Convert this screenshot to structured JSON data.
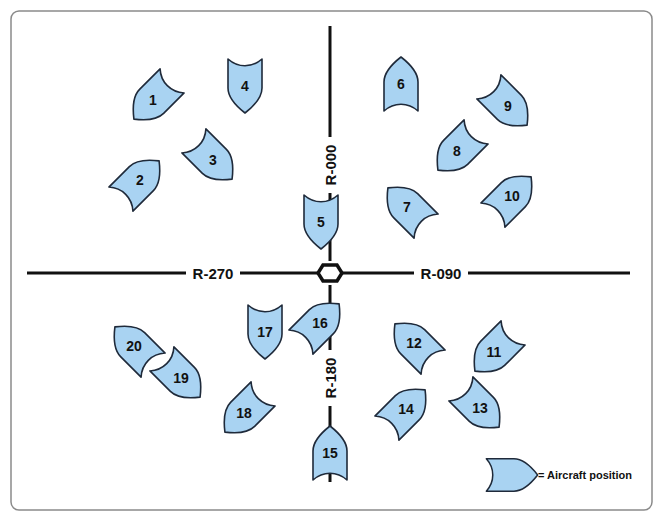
{
  "diagram": {
    "colors": {
      "aircraft_fill": "#a9d3f2",
      "aircraft_stroke": "#1f2a3a",
      "line": "#111111",
      "frame": "#8a8a8a"
    },
    "station": {
      "name": "VOR station",
      "x": 330,
      "y": 273
    },
    "radials": [
      {
        "label": "R-000",
        "direction": "north"
      },
      {
        "label": "R-090",
        "direction": "east"
      },
      {
        "label": "R-180",
        "direction": "south"
      },
      {
        "label": "R-270",
        "direction": "west"
      }
    ],
    "aircraft": [
      {
        "number": "1",
        "x": 153,
        "y": 100,
        "heading": 225
      },
      {
        "number": "2",
        "x": 140,
        "y": 180,
        "heading": 45
      },
      {
        "number": "3",
        "x": 213,
        "y": 160,
        "heading": 135
      },
      {
        "number": "4",
        "x": 245,
        "y": 86,
        "heading": 180
      },
      {
        "number": "5",
        "x": 321,
        "y": 222,
        "heading": 180
      },
      {
        "number": "6",
        "x": 401,
        "y": 84,
        "heading": 0
      },
      {
        "number": "7",
        "x": 407,
        "y": 207,
        "heading": 315
      },
      {
        "number": "8",
        "x": 457,
        "y": 151,
        "heading": 225
      },
      {
        "number": "9",
        "x": 508,
        "y": 106,
        "heading": 135
      },
      {
        "number": "10",
        "x": 512,
        "y": 196,
        "heading": 45
      },
      {
        "number": "11",
        "x": 494,
        "y": 352,
        "heading": 225
      },
      {
        "number": "12",
        "x": 414,
        "y": 343,
        "heading": 315
      },
      {
        "number": "13",
        "x": 480,
        "y": 408,
        "heading": 135
      },
      {
        "number": "14",
        "x": 406,
        "y": 409,
        "heading": 45
      },
      {
        "number": "15",
        "x": 330,
        "y": 453,
        "heading": 0
      },
      {
        "number": "16",
        "x": 320,
        "y": 323,
        "heading": 45
      },
      {
        "number": "17",
        "x": 265,
        "y": 332,
        "heading": 180
      },
      {
        "number": "18",
        "x": 244,
        "y": 413,
        "heading": 225
      },
      {
        "number": "19",
        "x": 181,
        "y": 378,
        "heading": 135
      },
      {
        "number": "20",
        "x": 134,
        "y": 346,
        "heading": 315
      }
    ],
    "legend": {
      "symbol": "aircraft-icon",
      "text": "= Aircraft position",
      "x": 512,
      "y": 475,
      "heading": 90
    }
  }
}
